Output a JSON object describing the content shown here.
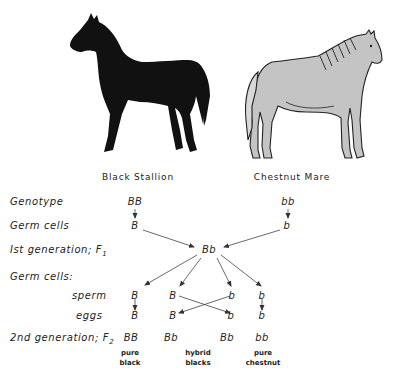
{
  "parents": {
    "left": {
      "caption": "Black Stallion",
      "color": "#111111"
    },
    "right": {
      "caption": "Chestnut Mare",
      "color": "#c4c4c4"
    }
  },
  "row_labels": {
    "genotype": "Genotype",
    "germ_cells": "Germ cells",
    "f1": "Ist generation; F",
    "f1_sub": "1",
    "germ_cells_2": "Germ cells:",
    "sperm": "sperm",
    "eggs": "eggs",
    "f2": "2nd generation; F",
    "f2_sub": "2"
  },
  "genotypes": {
    "parent_left": "BB",
    "parent_right": "bb",
    "germ_left": "B",
    "germ_right": "b",
    "f1": "Bb",
    "sperm": [
      "B",
      "B",
      "b",
      "b"
    ],
    "eggs": [
      "B",
      "B",
      "b",
      "b"
    ],
    "f2": [
      "BB",
      "Bb",
      "Bb",
      "bb"
    ]
  },
  "phenotypes": {
    "pure_black": [
      "pure",
      "black"
    ],
    "hybrid_blacks": [
      "hybrid",
      "blacks"
    ],
    "pure_chestnut": [
      "pure",
      "chestnut"
    ]
  }
}
